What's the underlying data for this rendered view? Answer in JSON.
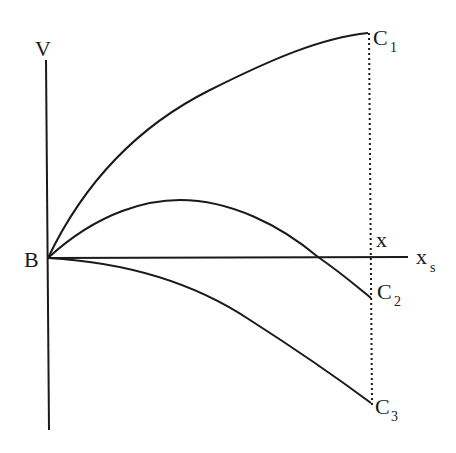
{
  "diagram": {
    "labels": {
      "v_axis": "V",
      "origin": "B",
      "x_axis": "x",
      "x_axis_sub": "s",
      "x_marker": "x",
      "c1": "C",
      "c1_sub": "1",
      "c2": "C",
      "c2_sub": "2",
      "c3": "C",
      "c3_sub": "3"
    },
    "colors": {
      "stroke": "#1a1a1a",
      "background": "#ffffff"
    },
    "curves": [
      {
        "name": "curve-BC1",
        "from": "B",
        "to": "C1",
        "shape": "concave rising"
      },
      {
        "name": "curve-BC2",
        "from": "B",
        "to": "C2",
        "shape": "rises then falls below axis"
      },
      {
        "name": "curve-BC3",
        "from": "B",
        "to": "C3",
        "shape": "falling below axis"
      }
    ]
  }
}
